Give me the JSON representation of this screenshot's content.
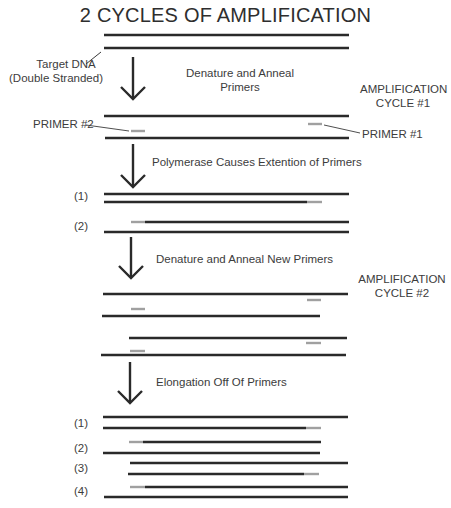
{
  "title": "2 CYCLES OF AMPLIFICATION",
  "labels": {
    "target_dna_line1": "Target DNA",
    "target_dna_line2": "(Double Stranded)",
    "step1_line1": "Denature and Anneal",
    "step1_line2": "Primers",
    "cycle1_line1": "AMPLIFICATION",
    "cycle1_line2": "CYCLE #1",
    "primer2": "PRIMER #2",
    "primer1": "PRIMER #1",
    "step2": "Polymerase Causes Extention of Primers",
    "step3": "Denature and Anneal New Primers",
    "cycle2_line1": "AMPLIFICATION",
    "cycle2_line2": "CYCLE #2",
    "step4": "Elongation Off Of Primers"
  },
  "strand_labels_cycle1": [
    "(1)",
    "(2)"
  ],
  "strand_labels_cycle2": [
    "(1)",
    "(2)",
    "(3)",
    "(4)"
  ],
  "colors": {
    "dna_strand": "#2a2a2a",
    "primer": "#a0a0a0",
    "arrow": "#2a2a2a",
    "text": "#3c3c3c"
  }
}
